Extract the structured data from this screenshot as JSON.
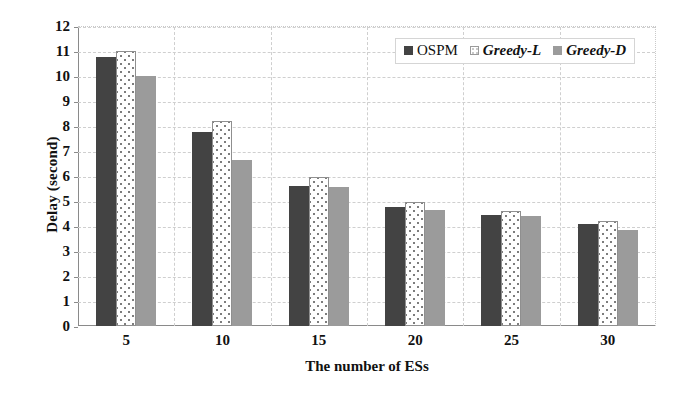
{
  "chart_data": {
    "type": "bar",
    "title": "",
    "xlabel": "The number of ESs",
    "ylabel": "Delay (second)",
    "categories": [
      "5",
      "10",
      "15",
      "20",
      "25",
      "30"
    ],
    "series": [
      {
        "name": "OSPM",
        "style": "solid-dark",
        "color": "#434343",
        "values": [
          10.75,
          7.75,
          5.6,
          4.75,
          4.45,
          4.1
        ]
      },
      {
        "name": "Greedy-L",
        "style": "dotted-white",
        "color": "#ffffff",
        "values": [
          11.0,
          8.2,
          5.95,
          4.95,
          4.6,
          4.2
        ]
      },
      {
        "name": "Greedy-D",
        "style": "solid-gray",
        "color": "#9b9b9b",
        "values": [
          10.0,
          6.65,
          5.55,
          4.65,
          4.4,
          3.85
        ]
      }
    ],
    "ylim": [
      0,
      12
    ],
    "yticks": [
      0,
      1,
      2,
      3,
      4,
      5,
      6,
      7,
      8,
      9,
      10,
      11,
      12
    ],
    "ytick_labels": [
      "0",
      "1",
      "2",
      "3",
      "4",
      "5",
      "6",
      "7",
      "8",
      "9",
      "10",
      "11",
      "12"
    ],
    "grid": true,
    "grid_style": "dashed",
    "legend_position": "top-right-inside",
    "legend": [
      {
        "label": "OSPM",
        "italic": false
      },
      {
        "label": "Greedy-L",
        "italic": true
      },
      {
        "label": "Greedy-D",
        "italic": true
      }
    ]
  }
}
